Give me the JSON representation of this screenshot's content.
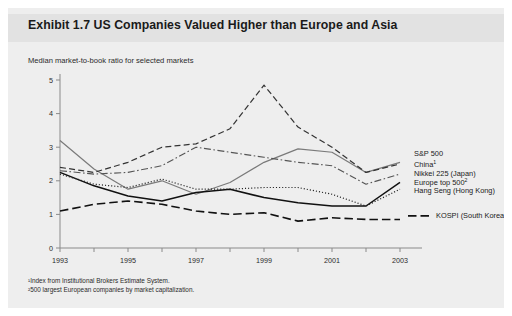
{
  "panel": {
    "title": "Exhibit 1.7 US Companies Valued Higher than Europe and Asia",
    "subtitle": "Median market-to-book ratio for selected markets"
  },
  "footnotes": [
    "¹Index from Institutional Brokers Estimate System.",
    "²500 largest European companies by market capitalization."
  ],
  "chart_data": {
    "type": "line",
    "title": "Exhibit 1.7 US Companies Valued Higher than Europe and Asia",
    "subtitle": "Median market-to-book ratio for selected markets",
    "xlabel": "",
    "ylabel": "",
    "x": [
      1993,
      1994,
      1995,
      1996,
      1997,
      1998,
      1999,
      2000,
      2001,
      2002,
      2003
    ],
    "xlim": [
      1993,
      2003
    ],
    "ylim": [
      0,
      5
    ],
    "yticks": [
      0,
      1,
      2,
      3,
      4,
      5
    ],
    "xticklabels": [
      "1993",
      "1995",
      "1997",
      "1999",
      "2001",
      "2003"
    ],
    "xticklabel_years": [
      1993,
      1995,
      1997,
      1999,
      2001,
      2003
    ],
    "grid": false,
    "legend_position": "right-inline",
    "series": [
      {
        "name": "S&P 500",
        "style": "solid",
        "color": "#7a7a7a",
        "width": 1.2,
        "values": [
          3.2,
          2.35,
          1.75,
          2.0,
          1.6,
          1.95,
          2.55,
          2.95,
          2.85,
          2.25,
          2.55
        ]
      },
      {
        "name": "China¹",
        "style": "dashed",
        "color": "#333333",
        "width": 1.2,
        "values": [
          2.4,
          2.25,
          2.55,
          3.0,
          3.1,
          3.55,
          4.85,
          3.6,
          3.0,
          2.25,
          2.5
        ]
      },
      {
        "name": "Europe top 500²",
        "style": "dashdot",
        "color": "#555555",
        "width": 1.1,
        "values": [
          2.3,
          2.2,
          2.25,
          2.45,
          3.0,
          2.85,
          2.7,
          2.55,
          2.45,
          1.9,
          2.2
        ]
      },
      {
        "name": "Nikkei 225 (Japan)",
        "style": "solid",
        "color": "#111111",
        "width": 1.5,
        "values": [
          2.25,
          1.85,
          1.55,
          1.4,
          1.65,
          1.75,
          1.5,
          1.35,
          1.25,
          1.25,
          1.95
        ]
      },
      {
        "name": "Hang Seng (Hong Kong)",
        "style": "dotted",
        "color": "#222222",
        "width": 1.2,
        "values": [
          2.2,
          1.9,
          1.8,
          2.05,
          1.75,
          1.75,
          1.8,
          1.8,
          1.6,
          1.25,
          1.75
        ]
      },
      {
        "name": "KOSPI (South Korea)",
        "style": "longdash",
        "color": "#111111",
        "width": 1.6,
        "values": [
          1.1,
          1.3,
          1.4,
          1.3,
          1.1,
          1.0,
          1.05,
          0.8,
          0.9,
          0.85,
          0.85
        ]
      }
    ],
    "legend_entries": [
      {
        "label": "S&P 500",
        "sup": ""
      },
      {
        "label": "China",
        "sup": "1"
      },
      {
        "label": "Europe top 500",
        "sup": "2"
      },
      {
        "label": "Nikkei 225 (Japan)",
        "sup": ""
      },
      {
        "label": "Hang Seng (Hong Kong)",
        "sup": ""
      },
      {
        "label": "KOSPI (South Korea)",
        "sup": ""
      }
    ]
  }
}
